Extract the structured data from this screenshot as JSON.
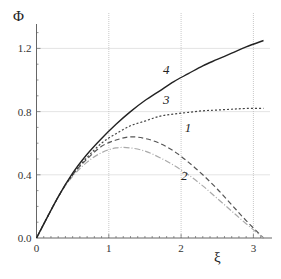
{
  "chart_data": {
    "type": "line",
    "title": "",
    "xlabel": "ξ",
    "ylabel": "Φ",
    "xlim": [
      0,
      3.2
    ],
    "ylim": [
      0,
      1.32
    ],
    "xticks": [
      "0",
      "1",
      "2",
      "3"
    ],
    "yticks": [
      "0.0",
      "0.4",
      "0.8",
      "1.2"
    ],
    "grid": true,
    "series": [
      {
        "name": "1",
        "style": "dashed",
        "color": "#555555",
        "x": [
          0,
          0.3,
          0.5,
          0.7,
          0.9,
          1.1,
          1.3,
          1.5,
          1.7,
          1.9,
          2.1,
          2.3,
          2.5,
          2.7,
          2.9,
          3.14
        ],
        "y": [
          0,
          0.26,
          0.4,
          0.5,
          0.58,
          0.62,
          0.64,
          0.63,
          0.6,
          0.55,
          0.48,
          0.4,
          0.31,
          0.21,
          0.11,
          0.0
        ]
      },
      {
        "name": "2",
        "style": "dash-dot",
        "color": "#aaaaaa",
        "x": [
          0,
          0.3,
          0.5,
          0.7,
          0.9,
          1.1,
          1.3,
          1.5,
          1.7,
          1.9,
          2.1,
          2.3,
          2.5,
          2.7,
          2.9,
          3.14
        ],
        "y": [
          0,
          0.26,
          0.39,
          0.48,
          0.54,
          0.57,
          0.57,
          0.55,
          0.51,
          0.46,
          0.4,
          0.33,
          0.25,
          0.17,
          0.09,
          0.0
        ]
      },
      {
        "name": "3",
        "style": "dotted",
        "color": "#444444",
        "x": [
          0,
          0.3,
          0.5,
          0.7,
          0.9,
          1.1,
          1.3,
          1.5,
          1.7,
          1.9,
          2.1,
          2.3,
          2.5,
          2.7,
          2.9,
          3.14
        ],
        "y": [
          0,
          0.26,
          0.4,
          0.51,
          0.6,
          0.66,
          0.71,
          0.74,
          0.77,
          0.785,
          0.795,
          0.805,
          0.81,
          0.815,
          0.82,
          0.82
        ]
      },
      {
        "name": "4",
        "style": "solid",
        "color": "#222222",
        "x": [
          0,
          0.3,
          0.5,
          0.7,
          0.9,
          1.1,
          1.3,
          1.5,
          1.7,
          1.9,
          2.1,
          2.3,
          2.5,
          2.7,
          2.9,
          3.14
        ],
        "y": [
          0,
          0.26,
          0.41,
          0.53,
          0.63,
          0.72,
          0.8,
          0.87,
          0.93,
          0.99,
          1.04,
          1.09,
          1.13,
          1.17,
          1.21,
          1.25
        ]
      }
    ],
    "annotations": [
      {
        "text": "1",
        "x": 2.05,
        "y": 0.67
      },
      {
        "text": "2",
        "x": 2.0,
        "y": 0.37
      },
      {
        "text": "3",
        "x": 1.75,
        "y": 0.85
      },
      {
        "text": "4",
        "x": 1.75,
        "y": 1.04
      }
    ]
  }
}
